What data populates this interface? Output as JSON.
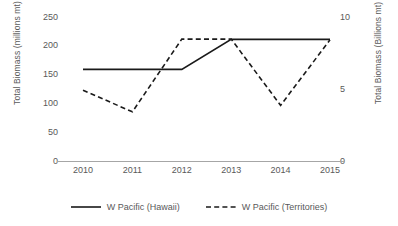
{
  "chart_data": {
    "type": "line",
    "title": "",
    "xlabel": "",
    "categories": [
      "2010",
      "2011",
      "2012",
      "2013",
      "2014",
      "2015"
    ],
    "x": [
      2010,
      2011,
      2012,
      2013,
      2014,
      2015
    ],
    "grid": false,
    "legend_position": "bottom",
    "axes": {
      "left": {
        "label": "Total Biomass (millions mt)",
        "ticks": [
          250,
          200,
          150,
          100,
          50,
          0
        ],
        "ticklabels": [
          "250",
          "200",
          "150",
          "100",
          "50",
          "0"
        ],
        "lim": [
          0,
          250
        ]
      },
      "right": {
        "label": "Total Biomass (Billions mt)",
        "ticks": [
          10,
          5,
          0
        ],
        "ticklabels": [
          "10",
          "5",
          "0"
        ],
        "lim": [
          0,
          10
        ]
      }
    },
    "series": [
      {
        "name": "W Pacific (Hawaii)",
        "axis": "left",
        "style": "solid",
        "color": "#1a1a1a",
        "values": [
          160,
          160,
          160,
          212,
          212,
          212
        ]
      },
      {
        "name": "W Pacific (Territories)",
        "axis": "right",
        "style": "dashed",
        "color": "#1a1a1a",
        "values": [
          4.95,
          3.45,
          8.5,
          8.5,
          3.9,
          8.45
        ]
      }
    ]
  },
  "legend": {
    "items": [
      {
        "label": "W Pacific (Hawaii)",
        "style": "solid"
      },
      {
        "label": "W Pacific (Territories)",
        "style": "dashed"
      }
    ]
  },
  "colors": {
    "background": "#ffffff",
    "text": "#595959",
    "line": "#1a1a1a",
    "axis": "#a6a6a6"
  }
}
